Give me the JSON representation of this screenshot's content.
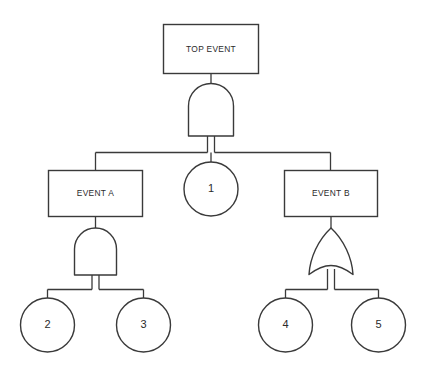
{
  "diagram": {
    "type": "fault-tree",
    "background_color": "#ffffff",
    "stroke_color": "#3a3a3a",
    "text_color": "#2b2b2b",
    "nodes": {
      "top_event": {
        "label": "TOP EVENT",
        "shape": "rectangle"
      },
      "event_a": {
        "label": "EVENT A",
        "shape": "rectangle"
      },
      "event_b": {
        "label": "EVENT B",
        "shape": "rectangle"
      },
      "basic_1": {
        "label": "1",
        "shape": "circle"
      },
      "basic_2": {
        "label": "2",
        "shape": "circle"
      },
      "basic_3": {
        "label": "3",
        "shape": "circle"
      },
      "basic_4": {
        "label": "4",
        "shape": "circle"
      },
      "basic_5": {
        "label": "5",
        "shape": "circle"
      }
    },
    "gates": {
      "top_gate": {
        "type": "AND"
      },
      "event_a_gate": {
        "type": "AND"
      },
      "event_b_gate": {
        "type": "OR"
      }
    }
  }
}
